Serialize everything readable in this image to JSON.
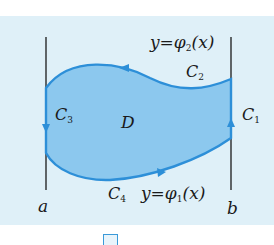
{
  "diagram": {
    "region_label": "D",
    "curves": [
      {
        "id": "C1",
        "label": "C",
        "subscript": "1",
        "description": "right vertical segment x=b, upward"
      },
      {
        "id": "C2",
        "label": "C",
        "subscript": "2",
        "description": "upper curve y=φ2(x), leftward"
      },
      {
        "id": "C3",
        "label": "C",
        "subscript": "3",
        "description": "left vertical segment x=a, downward"
      },
      {
        "id": "C4",
        "label": "C",
        "subscript": "4",
        "description": "lower curve y=φ1(x), rightward"
      }
    ],
    "upper_equation": {
      "prefix": "y=φ",
      "subscript": "2",
      "suffix": "(x)"
    },
    "lower_equation": {
      "prefix": "y=φ",
      "subscript": "1",
      "suffix": "(x)"
    },
    "axis_labels": {
      "left": "a",
      "right": "b"
    },
    "colors": {
      "background": "#dff0f8",
      "region_fill": "#8cc8ee",
      "boundary": "#2d8fd8",
      "lines": "#1a1a1a"
    }
  }
}
